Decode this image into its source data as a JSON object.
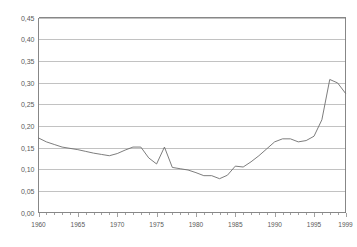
{
  "chart_data": {
    "type": "line",
    "title": "",
    "subtitle": "",
    "xlabel": "",
    "ylabel": "",
    "grid": "horizontal",
    "legend": "none",
    "xlim": [
      1960,
      1999
    ],
    "ylim": [
      0.0,
      0.45
    ],
    "ytick_labels": [
      "0,45",
      "0,40",
      "0,35",
      "0,30",
      "0,25",
      "0,20",
      "0,15",
      "0,10",
      "0,05",
      "0,00"
    ],
    "ytick_values": [
      0.45,
      0.4,
      0.35,
      0.3,
      0.25,
      0.2,
      0.15,
      0.1,
      0.05,
      0.0
    ],
    "xtick_labels": [
      "1960",
      "1965",
      "1970",
      "1975",
      "1980",
      "1985",
      "1990",
      "1995",
      "1999"
    ],
    "xtick_values": [
      1960,
      1965,
      1970,
      1975,
      1980,
      1985,
      1990,
      1995,
      1999
    ],
    "x": [
      1960,
      1961,
      1962,
      1963,
      1964,
      1965,
      1966,
      1967,
      1968,
      1969,
      1970,
      1971,
      1972,
      1973,
      1974,
      1975,
      1976,
      1977,
      1978,
      1979,
      1980,
      1981,
      1982,
      1983,
      1984,
      1985,
      1986,
      1987,
      1988,
      1989,
      1990,
      1991,
      1992,
      1993,
      1994,
      1995,
      1996,
      1997,
      1998,
      1999
    ],
    "values": [
      0.172,
      0.163,
      0.157,
      0.151,
      0.148,
      0.145,
      0.141,
      0.137,
      0.134,
      0.131,
      0.136,
      0.144,
      0.151,
      0.151,
      0.126,
      0.112,
      0.151,
      0.104,
      0.101,
      0.098,
      0.092,
      0.085,
      0.085,
      0.078,
      0.086,
      0.107,
      0.105,
      0.117,
      0.131,
      0.147,
      0.163,
      0.17,
      0.17,
      0.163,
      0.166,
      0.176,
      0.214,
      0.307,
      0.299,
      0.275
    ],
    "series": [
      {
        "name": "series-1",
        "color": "#6e6e6e",
        "values": [
          0.172,
          0.163,
          0.157,
          0.151,
          0.148,
          0.145,
          0.141,
          0.137,
          0.134,
          0.131,
          0.136,
          0.144,
          0.151,
          0.151,
          0.126,
          0.112,
          0.151,
          0.104,
          0.101,
          0.098,
          0.092,
          0.085,
          0.085,
          0.078,
          0.086,
          0.107,
          0.105,
          0.117,
          0.131,
          0.147,
          0.163,
          0.17,
          0.17,
          0.163,
          0.166,
          0.176,
          0.214,
          0.307,
          0.299,
          0.275
        ]
      }
    ]
  },
  "colors": {
    "line": "#6e6e6e",
    "grid": "#a8a8a8",
    "axis": "#7a7a7a",
    "text": "#5a5a5a",
    "background": "#ffffff"
  }
}
